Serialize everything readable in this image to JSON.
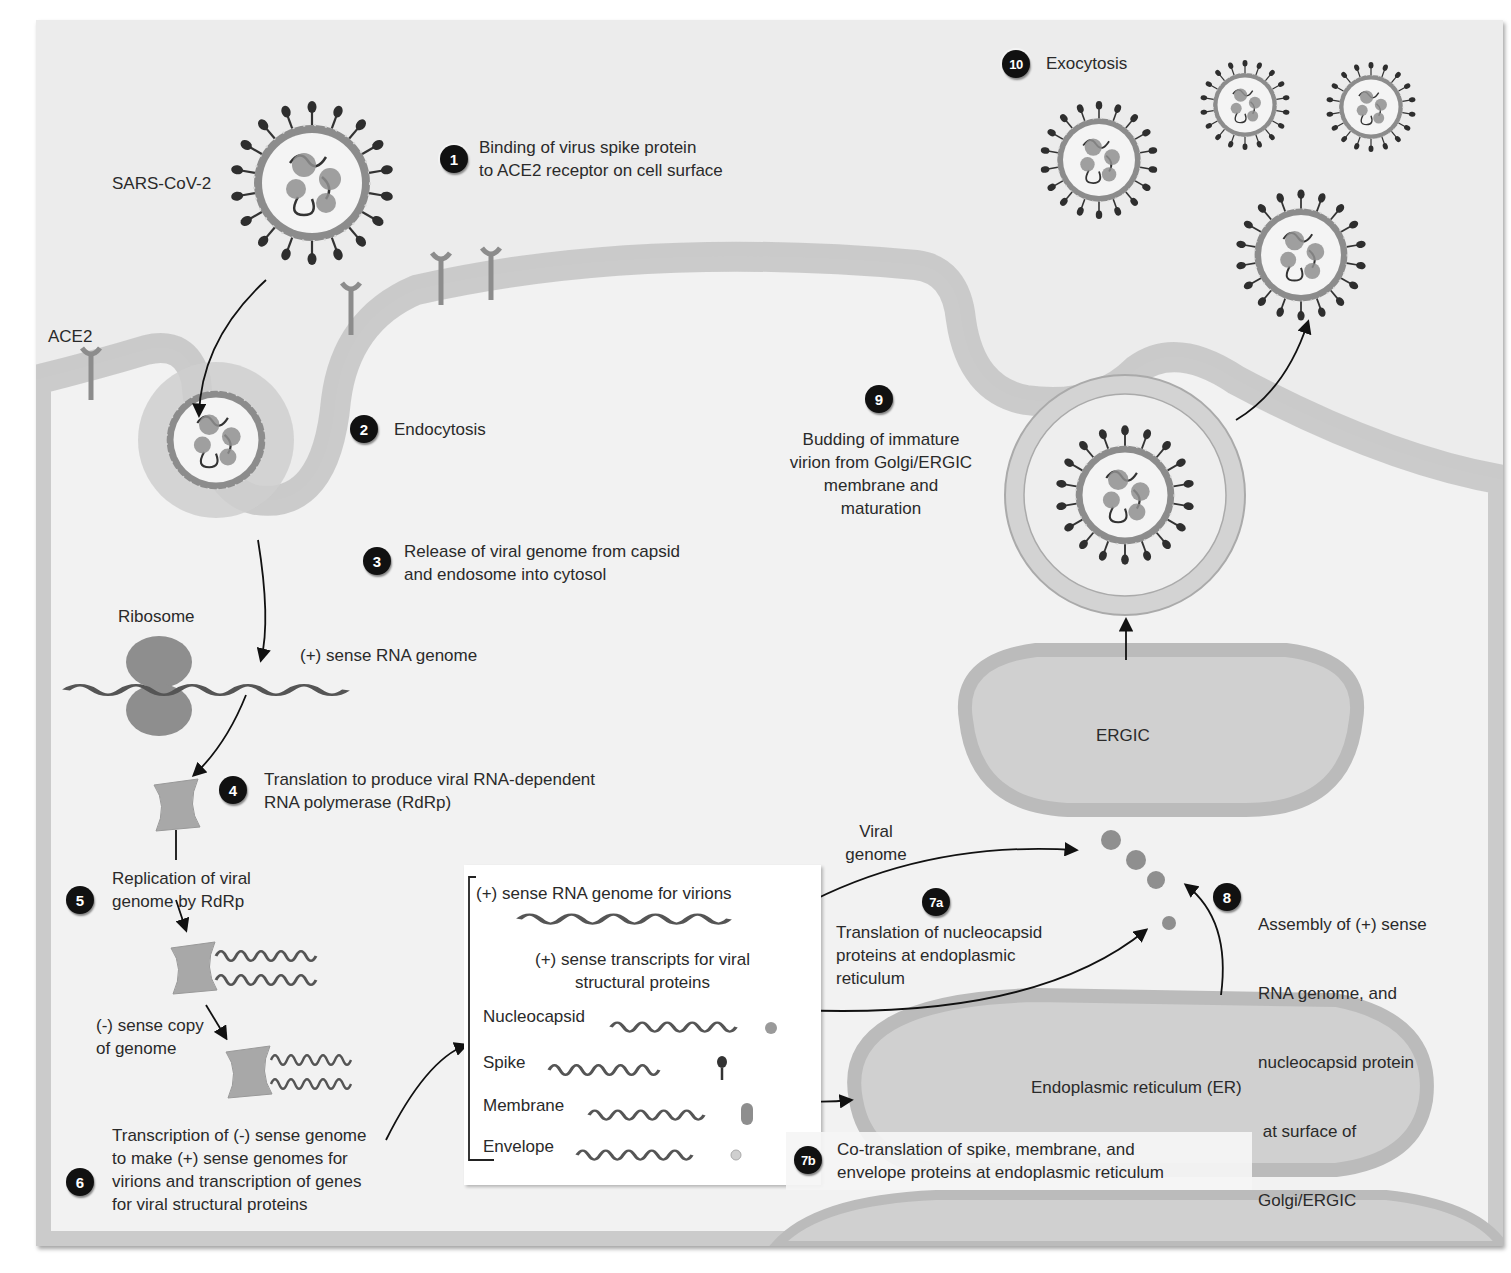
{
  "diagram": {
    "colors": {
      "background": "#ececec",
      "membrane": "#c9c9c9",
      "membrane_edge": "#a9a9a9",
      "cell_interior": "#f2f2f2",
      "spike": "#333333",
      "envelope_ring": "#8c8c8c",
      "nucleocapsid": "#8a8a8a",
      "badge": "#111111",
      "legend_bg": "#ffffff"
    },
    "labels": {
      "virus": "SARS-CoV-2",
      "receptor": "ACE2",
      "ribosome": "Ribosome",
      "plus_rna": "(+) sense RNA genome",
      "minus_copy_line1": "(-) sense copy",
      "minus_copy_line2": "of genome",
      "viral_genome_line1": "Viral",
      "viral_genome_line2": "genome",
      "ergic": "ERGIC",
      "er": "Endoplasmic reticulum (ER)"
    },
    "steps": [
      {
        "badge": "1",
        "lines": [
          "Binding of virus spike protein",
          "to ACE2 receptor on cell surface"
        ]
      },
      {
        "badge": "2",
        "lines": [
          "Endocytosis"
        ]
      },
      {
        "badge": "3",
        "lines": [
          "Release of viral genome from capsid",
          "and endosome into cytosol"
        ]
      },
      {
        "badge": "4",
        "lines": [
          "Translation to produce viral RNA-dependent",
          "RNA polymerase (RdRp)"
        ]
      },
      {
        "badge": "5",
        "lines": [
          "Replication of viral",
          "genome by RdRp"
        ]
      },
      {
        "badge": "6",
        "lines": [
          "Transcription of (-) sense genome",
          "to make (+) sense genomes for",
          "virions and transcription of genes",
          "for viral structural proteins"
        ]
      },
      {
        "badge": "7a",
        "lines": [
          "Translation of nucleocapsid",
          "proteins at endoplasmic",
          "reticulum"
        ]
      },
      {
        "badge": "7b",
        "lines": [
          "Co-translation of spike, membrane, and",
          "envelope proteins at endoplasmic reticulum"
        ]
      },
      {
        "badge": "8",
        "lines": [
          "Assembly of (+) sense",
          "RNA genome, and",
          "nucleocapsid protein",
          " at surface of",
          "Golgi/ERGIC"
        ]
      },
      {
        "badge": "9",
        "lines": [
          "Budding of immature",
          "virion from Golgi/ERGIC",
          "membrane and",
          "maturation"
        ]
      },
      {
        "badge": "10",
        "lines": [
          "Exocytosis"
        ]
      }
    ],
    "legend": {
      "genome_heading": "(+) sense RNA genome for virions",
      "transcripts_heading_line1": "(+) sense transcripts for viral",
      "transcripts_heading_line2": "structural proteins",
      "proteins": [
        {
          "name": "Nucleocapsid",
          "icon": "nucleocapsid-dot"
        },
        {
          "name": "Spike",
          "icon": "spike-lollipop"
        },
        {
          "name": "Membrane",
          "icon": "membrane-capsule"
        },
        {
          "name": "Envelope",
          "icon": "envelope-dot"
        }
      ]
    }
  }
}
